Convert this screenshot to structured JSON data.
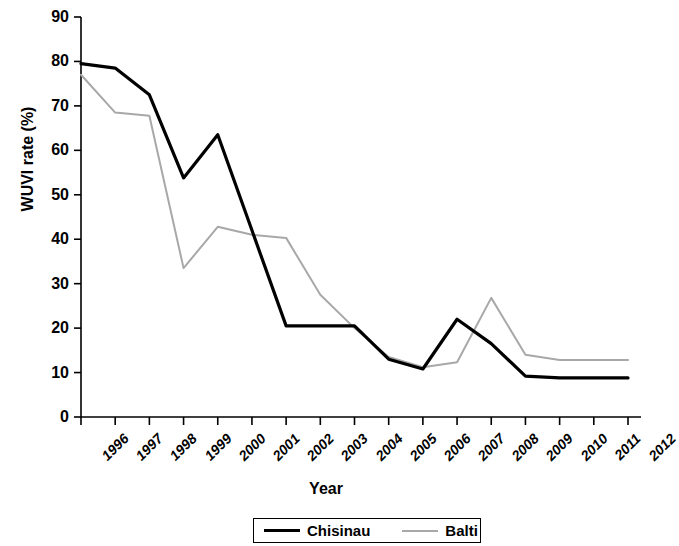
{
  "chart_data": {
    "type": "line",
    "title": "",
    "xlabel": "Year",
    "ylabel": "WUVI rate (%)",
    "categories": [
      "1996",
      "1997",
      "1998",
      "1999",
      "2000",
      "2001",
      "2002",
      "2003",
      "2004",
      "2005",
      "2006",
      "2007",
      "2008",
      "2009",
      "2010",
      "2011",
      "2012"
    ],
    "series": [
      {
        "name": "Chisinau",
        "color": "#000000",
        "values": [
          79.5,
          78.5,
          72.5,
          53.8,
          63.5,
          42.0,
          20.5,
          20.5,
          20.5,
          13.0,
          10.8,
          22.0,
          16.5,
          9.2,
          8.8,
          8.8,
          8.8
        ]
      },
      {
        "name": "Balti",
        "color": "#a8a8a8",
        "values": [
          77.0,
          68.5,
          67.8,
          33.5,
          42.8,
          41.0,
          40.3,
          27.5,
          20.0,
          13.5,
          11.2,
          12.3,
          26.8,
          14.0,
          12.8,
          12.8,
          12.8
        ]
      }
    ],
    "ylim": [
      0,
      90
    ],
    "yticks": [
      0,
      10,
      20,
      30,
      40,
      50,
      60,
      70,
      80,
      90
    ],
    "grid": false,
    "legend_position": "bottom"
  },
  "axis": {
    "y_tick_labels": [
      "90",
      "80",
      "70",
      "60",
      "50",
      "40",
      "30",
      "20",
      "10",
      "0"
    ]
  },
  "legend": {
    "entries": [
      {
        "label": "Chisinau"
      },
      {
        "label": "Balti"
      }
    ]
  }
}
